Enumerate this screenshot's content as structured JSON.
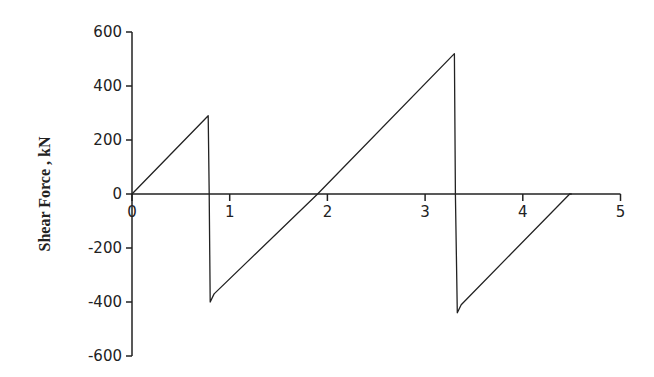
{
  "chart_data": {
    "type": "line",
    "title": "",
    "xlabel": "",
    "ylabel": "Shear Force , kN",
    "xlim": [
      0,
      5
    ],
    "ylim": [
      -600,
      600
    ],
    "x_ticks": [
      0,
      1,
      2,
      3,
      4,
      5
    ],
    "y_ticks": [
      600,
      400,
      200,
      0,
      -200,
      -400,
      -600
    ],
    "grid": false,
    "legend": null,
    "series": [
      {
        "name": "Shear Force",
        "color": "#222222",
        "x": [
          0,
          0.78,
          0.79,
          0.8,
          0.84,
          1.9,
          3.3,
          3.31,
          3.33,
          3.37,
          4.48,
          4.5
        ],
        "y": [
          0,
          290,
          0,
          -400,
          -370,
          0,
          520,
          0,
          -440,
          -410,
          0,
          0
        ]
      }
    ]
  }
}
